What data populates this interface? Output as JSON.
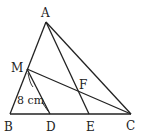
{
  "diagram": {
    "type": "geometry",
    "points": {
      "A": {
        "label": "A",
        "x": 46,
        "y": 22
      },
      "B": {
        "label": "B",
        "x": 10,
        "y": 114
      },
      "C": {
        "label": "C",
        "x": 131,
        "y": 114
      },
      "M": {
        "label": "M",
        "x": 27,
        "y": 69
      },
      "D": {
        "label": "D",
        "x": 50,
        "y": 114
      },
      "E": {
        "label": "E",
        "x": 89,
        "y": 114
      },
      "F": {
        "label": "F",
        "x": 78,
        "y": 91
      }
    },
    "segments": [
      "AB",
      "AC",
      "BC",
      "AE",
      "MC",
      "MD"
    ],
    "measurement": {
      "segment": "MD",
      "label": "8 cm"
    }
  }
}
